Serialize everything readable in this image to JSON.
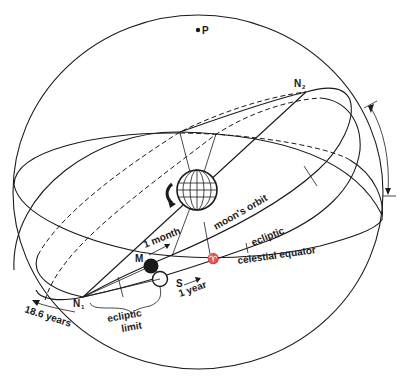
{
  "diagram": {
    "type": "celestial-sphere",
    "colors": {
      "ink": "#1a1a1a",
      "background": "#ffffff"
    },
    "labels": {
      "pole": "P",
      "node_ascending": "N",
      "node_ascending_sub": "1",
      "node_descending": "N",
      "node_descending_sub": "2",
      "moon": "M",
      "sun": "S",
      "vernal_equinox": "♈",
      "moons_orbit": "moon's  orbit",
      "ecliptic": "ecliptic",
      "celestial_equator": "celestial  equator",
      "one_month": "1 month",
      "one_year": "1 year",
      "nodal_period": "18.6 years",
      "ecliptic_limit_line1": "ecliptic",
      "ecliptic_limit_line2": "limit"
    },
    "elements": [
      "celestial-sphere-outline",
      "celestial-equator",
      "ecliptic",
      "moons-orbit",
      "earth-globe",
      "earth-rotation-arrow",
      "moon-filled-circle",
      "sun-open-circle",
      "node-n1",
      "node-n2",
      "north-pole-point",
      "inclination-range-arrow",
      "ecliptic-limit-brace",
      "nodal-regression-arrow"
    ]
  }
}
